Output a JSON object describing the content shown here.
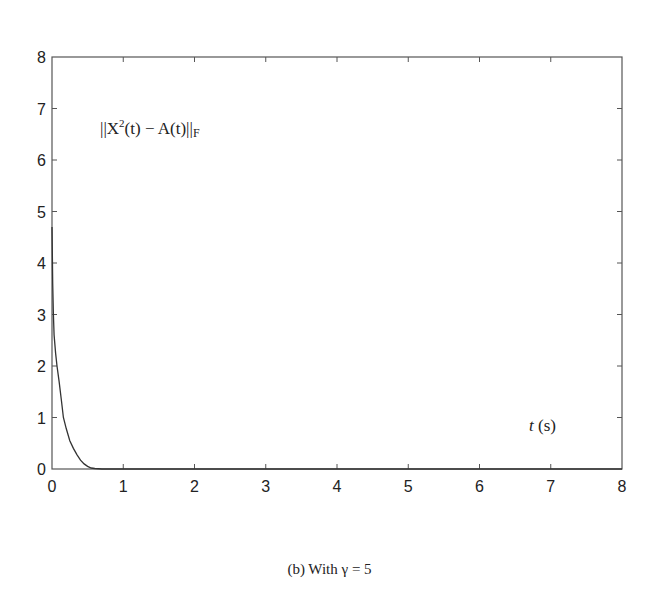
{
  "chart_data": {
    "type": "line",
    "title": "",
    "xlabel": "t (s)",
    "ylabel": "",
    "annotation": "||X^2(t) − A(t)||_F",
    "xlim": [
      0,
      8
    ],
    "ylim": [
      0,
      8
    ],
    "xticks": [
      0,
      1,
      2,
      3,
      4,
      5,
      6,
      7,
      8
    ],
    "yticks": [
      0,
      1,
      2,
      3,
      4,
      5,
      6,
      7,
      8
    ],
    "grid": false,
    "legend": null,
    "series": [
      {
        "name": "||X^2(t) − A(t)||_F",
        "x": [
          0.0,
          0.01,
          0.02,
          0.03,
          0.05,
          0.07,
          0.1,
          0.13,
          0.16,
          0.2,
          0.25,
          0.3,
          0.35,
          0.4,
          0.45,
          0.5,
          0.55,
          0.6,
          0.7,
          0.8,
          1.0,
          2.0,
          3.0,
          4.0,
          5.0,
          6.0,
          7.0,
          8.0
        ],
        "y": [
          4.7,
          3.6,
          3.0,
          2.6,
          2.25,
          2.0,
          1.7,
          1.35,
          1.0,
          0.78,
          0.55,
          0.4,
          0.28,
          0.17,
          0.1,
          0.05,
          0.02,
          0.01,
          0.0,
          0.0,
          0.0,
          0.0,
          0.0,
          0.0,
          0.0,
          0.0,
          0.0,
          0.0
        ]
      }
    ]
  },
  "labels": {
    "annotation_main": "||X",
    "annotation_sup": "2",
    "annotation_rest": "(t) − A(t)||",
    "annotation_sub": "F",
    "xlabel_var": "t",
    "xlabel_unit": " (s)",
    "caption": "(b) With γ = 5"
  },
  "colors": {
    "axis": "#555555",
    "line": "#333333",
    "text": "#222222"
  }
}
